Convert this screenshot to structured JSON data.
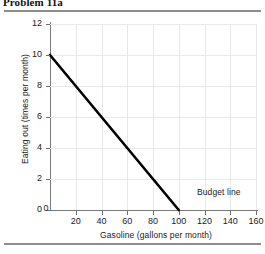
{
  "title": "Problem 11a",
  "chart_data": {
    "type": "line",
    "title": "Problem 11a",
    "xlabel": "Gasoline (gallons per month)",
    "ylabel": "Eating out (times per month)",
    "xlim": [
      0,
      160
    ],
    "ylim": [
      0,
      12
    ],
    "xticks": [
      0,
      20,
      40,
      60,
      80,
      100,
      120,
      140,
      160
    ],
    "yticks": [
      0,
      2,
      4,
      6,
      8,
      10,
      12
    ],
    "xtick_labels": [
      "0",
      "20",
      "40",
      "60",
      "80",
      "100",
      "120",
      "140",
      "160"
    ],
    "ytick_labels": [
      "0",
      "2",
      "4",
      "6",
      "8",
      "10",
      "12"
    ],
    "grid": true,
    "legend": "none",
    "series": [
      {
        "name": "Budget line",
        "annotation": "Budget line",
        "color": "#000000",
        "x": [
          0,
          100
        ],
        "y": [
          10,
          0
        ],
        "points": [
          [
            0,
            10
          ],
          [
            100,
            0
          ]
        ]
      }
    ]
  },
  "axis_titles": {
    "x": "Gasoline (gallons per month)",
    "y": "Eating out (times per month)"
  },
  "annotations": {
    "budget_line": "Budget line"
  },
  "colors": {
    "line": "#000000",
    "grid": "#e9e9e9",
    "axis": "#7a7a7a",
    "rule": "#8d8d8d",
    "text": "#1a1a1a"
  }
}
